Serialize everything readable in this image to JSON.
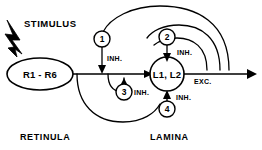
{
  "diagram": {
    "background_color": "#ffffff",
    "line_color": "#000000",
    "input": {
      "label": "STIMULUS",
      "icon": "lightning-bolt-icon"
    },
    "nodes": [
      {
        "id": "r1r6",
        "label": "R1 - R6",
        "shape": "ellipse"
      },
      {
        "id": "l1l2",
        "label": "L1, L2",
        "shape": "circle"
      }
    ],
    "interneurons": [
      {
        "id": "n1",
        "label": "1",
        "effect": "INH."
      },
      {
        "id": "n2",
        "label": "2",
        "effect": "INH."
      },
      {
        "id": "n3",
        "label": "3",
        "effect": "INH."
      },
      {
        "id": "n4",
        "label": "4",
        "effect": "INH."
      }
    ],
    "edge_labels": {
      "inh_1": "INH.",
      "inh_2": "INH.",
      "inh_3": "INH.",
      "inh_4": "INH.",
      "exc_out": "EXC."
    },
    "regions": [
      {
        "id": "retinula",
        "label": "RETINULA"
      },
      {
        "id": "lamina",
        "label": "LAMINA"
      }
    ]
  }
}
